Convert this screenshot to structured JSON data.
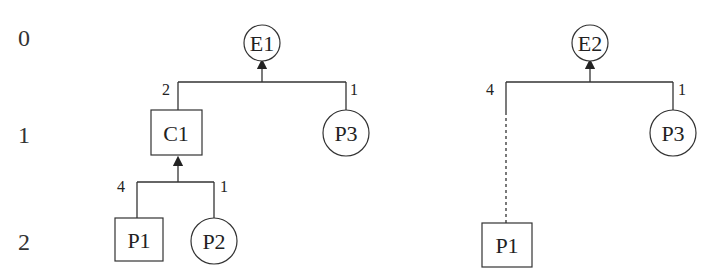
{
  "levels": [
    "0",
    "1",
    "2"
  ],
  "tree1": {
    "root": {
      "label": "E1",
      "shape": "circle"
    },
    "edge_weights": {
      "left": "2",
      "right": "1"
    },
    "children": [
      {
        "label": "C1",
        "shape": "box"
      },
      {
        "label": "P3",
        "shape": "circle"
      }
    ],
    "c1_edge_weights": {
      "left": "4",
      "right": "1"
    },
    "c1_children": [
      {
        "label": "P1",
        "shape": "box"
      },
      {
        "label": "P2",
        "shape": "circle"
      }
    ]
  },
  "tree2": {
    "root": {
      "label": "E2",
      "shape": "circle"
    },
    "edge_weights": {
      "left": "4",
      "right": "1"
    },
    "children": [
      {
        "label": "P1",
        "shape": "box",
        "link": "dashed"
      },
      {
        "label": "P3",
        "shape": "circle"
      }
    ]
  }
}
